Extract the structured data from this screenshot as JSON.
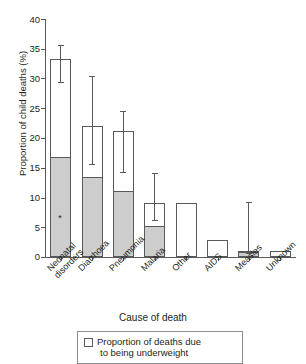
{
  "chart_data": {
    "type": "bar",
    "title": "",
    "xlabel": "Cause of death",
    "ylabel": "Proportion of child deaths (%)",
    "ylim": [
      0,
      40
    ],
    "yticks": [
      0,
      5,
      10,
      15,
      20,
      25,
      30,
      35,
      40
    ],
    "grid": false,
    "legend_position": "bottom",
    "categories": [
      "Neonatal disorders",
      "Diarrhoea",
      "Pneumonia",
      "Malaria",
      "Other",
      "AIDS",
      "Measles",
      "Unknown"
    ],
    "category_lines": [
      [
        "Neonatal",
        "disorders"
      ],
      [
        "Diarrhoea"
      ],
      [
        "Pneumonia"
      ],
      [
        "Malaria"
      ],
      [
        "Other"
      ],
      [
        "AIDS"
      ],
      [
        "Measles"
      ],
      [
        "Unknown"
      ]
    ],
    "series": [
      {
        "name": "Total proportion of child deaths",
        "values": [
          33.3,
          22.0,
          21.1,
          9.1,
          9.1,
          2.8,
          1.0,
          1.0
        ]
      },
      {
        "name": "Proportion of deaths due to being underweight",
        "values": [
          16.7,
          13.2,
          11.0,
          5.0,
          0,
          0,
          0.7,
          0
        ]
      }
    ],
    "error_bars": [
      {
        "low": 29.3,
        "high": 35.5
      },
      {
        "low": 15.5,
        "high": 30.2
      },
      {
        "low": 14.2,
        "high": 24.3
      },
      {
        "low": 6.0,
        "high": 14.0
      },
      null,
      null,
      {
        "low": 0.5,
        "high": 9.0
      },
      null
    ],
    "annotations": [
      {
        "category": "Neonatal disorders",
        "marker": "*",
        "value": 6.3
      }
    ],
    "legend": {
      "swatch": "open-square",
      "line1": "Proportion of deaths due",
      "line2": "to being underweight"
    },
    "colors": {
      "underweight_fill": "#cdcdcd",
      "bar_outline": "#58595b",
      "bar_fill": "#ffffff",
      "text": "#231f20"
    }
  }
}
